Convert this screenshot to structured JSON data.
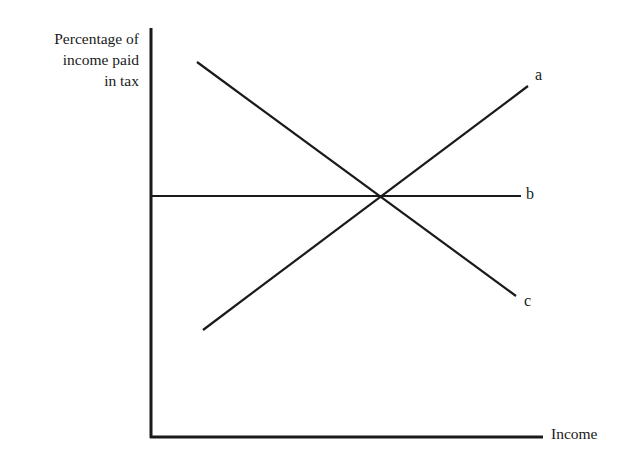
{
  "diagram": {
    "y_axis_label": [
      "Percentage of",
      "income paid",
      "in tax"
    ],
    "x_axis_label": "Income",
    "lines": [
      {
        "label": "a",
        "description": "upward sloping (progressive tax)",
        "x1": 203,
        "y1": 330,
        "x2": 528,
        "y2": 86
      },
      {
        "label": "b",
        "description": "horizontal (proportional tax)",
        "x1": 152,
        "y1": 196,
        "x2": 521,
        "y2": 196
      },
      {
        "label": "c",
        "description": "downward sloping (regressive tax)",
        "x1": 197,
        "y1": 62,
        "x2": 516,
        "y2": 296
      }
    ],
    "line_color": "#1a1a1a"
  }
}
